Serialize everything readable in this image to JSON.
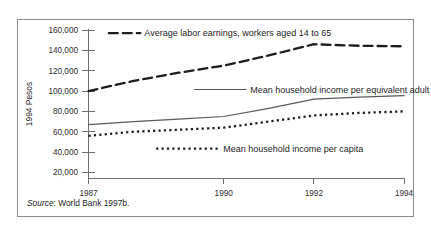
{
  "figure": {
    "source_note_prefix": "Source",
    "source_note_text": ": World Bank 1997b."
  },
  "chart_data": {
    "type": "line",
    "title": "",
    "xlabel": "",
    "ylabel": "1994 Pesos",
    "x": [
      1987,
      1988,
      1989,
      1990,
      1991,
      1992,
      1993,
      1994
    ],
    "xlim": [
      1987,
      1994
    ],
    "ylim": [
      0,
      165000
    ],
    "x_tick_labels": [
      "1987",
      "1990",
      "1992",
      "1994"
    ],
    "x_ticks": [
      1987,
      1990,
      1992,
      1994
    ],
    "y_ticks": [
      20000,
      40000,
      60000,
      80000,
      100000,
      120000,
      140000,
      160000
    ],
    "y_tick_labels": [
      "20,000",
      "40,000",
      "60,000",
      "80,000",
      "100,000",
      "120,000",
      "140,000",
      "160,000"
    ],
    "grid": false,
    "legend_position": "inline-annotations",
    "series": [
      {
        "name": "Average labor earnings, workers aged 14 to 65",
        "style": "dashed",
        "color": "#1d1d1d",
        "width": 2.3,
        "dash": "9,5",
        "values": [
          100000,
          110000,
          118000,
          125000,
          135000,
          146000,
          144500,
          144000
        ],
        "label_x": 1988.25,
        "label_y": 157000,
        "sample_from": 1987.45,
        "sample_to": 1988.15
      },
      {
        "name": "Mean household income per equivalent adult",
        "style": "solid",
        "color": "#585858",
        "width": 1.2,
        "dash": "none",
        "values": [
          67000,
          70000,
          72500,
          75000,
          83000,
          92000,
          94000,
          95500
        ],
        "label_x": 1990.6,
        "label_y": 101500,
        "sample_from": 1989.35,
        "sample_to": 1990.5
      },
      {
        "name": "Mean household income per capita",
        "style": "dotted",
        "color": "#1d1d1d",
        "width": 2.3,
        "dash": "2.2,3.2",
        "values": [
          56000,
          60000,
          62000,
          64000,
          70000,
          76000,
          78500,
          80000
        ],
        "label_x": 1990.0,
        "label_y": 43500,
        "sample_from": 1988.5,
        "sample_to": 1989.9
      }
    ]
  }
}
